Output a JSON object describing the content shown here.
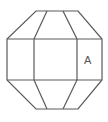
{
  "diagram": {
    "type": "octagonal prism face layout",
    "line_color": "#5a5a5a",
    "background": "#ffffff",
    "outline_points": [
      [
        36,
        11
      ],
      [
        78,
        11
      ],
      [
        102,
        39
      ],
      [
        102,
        80
      ],
      [
        78,
        109
      ],
      [
        36,
        109
      ],
      [
        7,
        80
      ],
      [
        7,
        39
      ]
    ],
    "band": {
      "top_y": 39,
      "bottom_y": 80,
      "left_x": 7,
      "right_x": 102,
      "inner_left_x": 34,
      "inner_right_x": 77
    },
    "top_inner_points": {
      "left_x": 47,
      "right_x": 63,
      "y": 11
    },
    "bottom_inner_points": {
      "left_x": 47,
      "right_x": 63,
      "y": 109
    },
    "labels": [
      {
        "text": "A",
        "x": 88,
        "y": 61,
        "face": "right-middle"
      }
    ]
  },
  "caption": {
    "text": "… … …",
    "note_visible": "partially cut off at bottom edge"
  }
}
